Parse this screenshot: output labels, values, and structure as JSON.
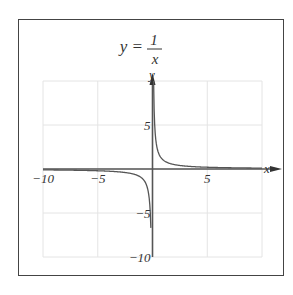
{
  "chart_data": {
    "type": "line",
    "title_lhs": "y =",
    "title_num": "1",
    "title_den": "x",
    "xlabel": "x",
    "ylabel": "y",
    "xlim": [
      -10,
      10
    ],
    "ylim": [
      -10,
      10
    ],
    "grid": true,
    "x_ticks": [
      {
        "value": -10,
        "label": "−10"
      },
      {
        "value": -5,
        "label": "−5"
      },
      {
        "value": 5,
        "label": "5"
      }
    ],
    "y_ticks": [
      {
        "value": 5,
        "label": "5"
      },
      {
        "value": -5,
        "label": "−5"
      },
      {
        "value": -10,
        "label": "−10"
      }
    ],
    "series": [
      {
        "name": "y = 1/x",
        "function": "1/x",
        "domain": [
          [
            -10,
            -0.1
          ],
          [
            0.1,
            10
          ]
        ],
        "color": "#555555"
      }
    ]
  }
}
